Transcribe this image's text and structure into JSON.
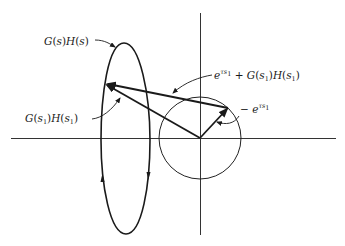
{
  "figure": {
    "colors": {
      "ink": "#1a1a1a",
      "background": "#ffffff"
    },
    "labels": {
      "contour": {
        "f": "G",
        "s": "s",
        "h": "H",
        "s2": "s"
      },
      "point": {
        "f": "G",
        "s": "s",
        "sub1": "1",
        "h": "H",
        "s2": "s",
        "sub2": "1"
      },
      "sum": {
        "e": "e",
        "exp": "τs",
        "expsub": "1",
        "plus": "+",
        "f": "G",
        "s": "s",
        "sub1": "1",
        "h": "H",
        "s2": "s",
        "sub2": "1"
      },
      "neg": {
        "minus": "−",
        "e": "e",
        "exp": "τs",
        "expsub": "1"
      }
    },
    "label_text": {
      "contour": "G(s)H(s)",
      "point": "G(s1)H(s1)",
      "sum": "e^{τs1} + G(s1)H(s1)",
      "neg": "−e^{τs1}"
    },
    "geometry": {
      "axes_origin": [
        200,
        138
      ],
      "unit_circle_radius": 41,
      "contour_top": [
        124,
        43
      ],
      "contour_bottom": [
        126,
        234
      ],
      "point_G_s1": [
        105,
        84
      ],
      "point_neg_e": [
        228,
        108
      ]
    }
  }
}
